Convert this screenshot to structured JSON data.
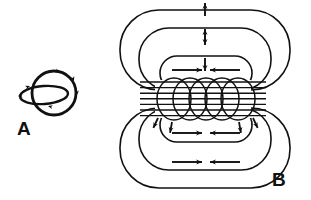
{
  "figure": {
    "background_color": "#ffffff",
    "ink_color": "#111111",
    "width": 311,
    "height": 200
  },
  "panels": [
    {
      "id": "A",
      "label": "A",
      "label_x": 17,
      "label_y": 135,
      "caption": "Single circular current loop with encircling magnetic field line",
      "current_loop": {
        "name": "current-loop-ellipse",
        "cx": 44,
        "cy": 95,
        "rx": 24,
        "ry": 9,
        "rotation": -4,
        "stroke_width": 2.4
      },
      "field_line": {
        "name": "field-line-circle",
        "cx": 54,
        "cy": 93,
        "r": 22,
        "stroke_width": 2.8
      },
      "arrow_marks": [
        {
          "name": "field-arrow-left",
          "x": 18,
          "y": 96,
          "angle": 180
        },
        {
          "name": "field-arrow-top",
          "x": 60,
          "y": 72,
          "angle": 20
        },
        {
          "name": "field-arrow-upper-right",
          "x": 74,
          "y": 81,
          "angle": 70
        },
        {
          "name": "field-arrow-right",
          "x": 77,
          "y": 95,
          "angle": 90
        },
        {
          "name": "field-arrow-bottom",
          "x": 48,
          "y": 106,
          "angle": 195
        },
        {
          "name": "current-arrow-left",
          "x": 30,
          "y": 86,
          "angle": 340
        }
      ]
    },
    {
      "id": "B",
      "label": "B",
      "label_x": 272,
      "label_y": 186,
      "caption": "Solenoid coil with nested magnetic field loops",
      "field_loops_top": [
        {
          "name": "field-loop-top-outer",
          "x": 120,
          "y": 10,
          "w": 170,
          "h": 80,
          "r": 39,
          "stroke_width": 1.6
        },
        {
          "name": "field-loop-top-middle",
          "x": 139,
          "y": 28,
          "w": 132,
          "h": 62,
          "r": 30,
          "stroke_width": 1.6
        },
        {
          "name": "field-loop-top-inner",
          "x": 160,
          "y": 56,
          "w": 92,
          "h": 34,
          "r": 17,
          "stroke_width": 1.6
        }
      ],
      "field_loops_bottom": [
        {
          "name": "field-loop-bottom-outer",
          "x": 120,
          "y": 108,
          "w": 170,
          "h": 80,
          "r": 39,
          "stroke_width": 1.6
        },
        {
          "name": "field-loop-bottom-middle",
          "x": 139,
          "y": 108,
          "w": 132,
          "h": 62,
          "r": 30,
          "stroke_width": 1.6
        },
        {
          "name": "field-loop-bottom-inner",
          "x": 160,
          "y": 108,
          "w": 92,
          "h": 34,
          "r": 17,
          "stroke_width": 1.6
        }
      ],
      "coil": {
        "name": "solenoid-coil",
        "turns": 5,
        "cy": 99,
        "rx": 17,
        "ry": 21,
        "spacing": 16,
        "first_cx": 174,
        "stroke_width": 1.5,
        "core_lines": {
          "name": "coil-core-field-lines",
          "count": 7,
          "x1": 140,
          "x2": 266,
          "y_start": 82,
          "y_step": 5.6,
          "stroke_width": 1.4
        }
      },
      "vertical_arrow_pairs": [
        {
          "name": "vertical-arrow-up-1",
          "x": 205,
          "y": 16,
          "direction": "up",
          "length": 13
        },
        {
          "name": "vertical-arrow-down-1",
          "x": 205,
          "y": 32,
          "direction": "down",
          "length": 13
        },
        {
          "name": "vertical-arrow-up-2",
          "x": 205,
          "y": 42,
          "direction": "up",
          "length": 13
        },
        {
          "name": "vertical-arrow-down-2",
          "x": 205,
          "y": 58,
          "direction": "down",
          "length": 13
        }
      ],
      "horizontal_arrow_pairs": [
        {
          "name": "horizontal-arrow-right-inner-top",
          "x": 172,
          "y": 70,
          "direction": "right",
          "length": 30
        },
        {
          "name": "horizontal-arrow-left-inner-top",
          "x": 240,
          "y": 70,
          "direction": "left",
          "length": 30
        },
        {
          "name": "horizontal-arrow-right-inner-bottom",
          "x": 172,
          "y": 133,
          "direction": "right",
          "length": 30
        },
        {
          "name": "horizontal-arrow-left-inner-bottom",
          "x": 240,
          "y": 133,
          "direction": "left",
          "length": 30
        },
        {
          "name": "horizontal-arrow-right-outer-bottom",
          "x": 172,
          "y": 162,
          "direction": "right",
          "length": 30
        },
        {
          "name": "horizontal-arrow-left-outer-bottom",
          "x": 240,
          "y": 162,
          "direction": "left",
          "length": 30
        }
      ],
      "diagonal_arrows": [
        {
          "name": "diagonal-arrow-lower-left",
          "x": 158,
          "y": 118,
          "angle": 115
        },
        {
          "name": "diagonal-arrow-lower-left-2",
          "x": 172,
          "y": 122,
          "angle": 100
        },
        {
          "name": "diagonal-arrow-lower-right",
          "x": 253,
          "y": 118,
          "angle": 65
        },
        {
          "name": "diagonal-arrow-lower-right-2",
          "x": 239,
          "y": 122,
          "angle": 80
        }
      ]
    }
  ]
}
